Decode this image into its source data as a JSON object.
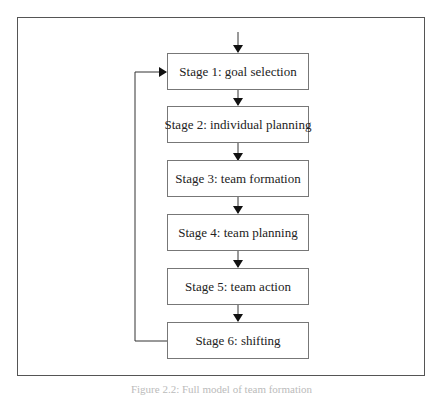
{
  "diagram": {
    "type": "flowchart",
    "stages": [
      {
        "label": "Stage 1: goal selection"
      },
      {
        "label": "Stage 2: individual planning"
      },
      {
        "label": "Stage 3: team formation"
      },
      {
        "label": "Stage 4: team planning"
      },
      {
        "label": "Stage 5: team action"
      },
      {
        "label": "Stage 6: shifting"
      }
    ],
    "edges": [
      {
        "from": "entry",
        "to": "Stage 1"
      },
      {
        "from": "Stage 1",
        "to": "Stage 2"
      },
      {
        "from": "Stage 2",
        "to": "Stage 3"
      },
      {
        "from": "Stage 3",
        "to": "Stage 4"
      },
      {
        "from": "Stage 4",
        "to": "Stage 5"
      },
      {
        "from": "Stage 5",
        "to": "Stage 6"
      },
      {
        "from": "Stage 6",
        "to": "Stage 1",
        "kind": "feedback-loop"
      }
    ]
  },
  "caption": "Figure 2.2: Full model of team formation"
}
